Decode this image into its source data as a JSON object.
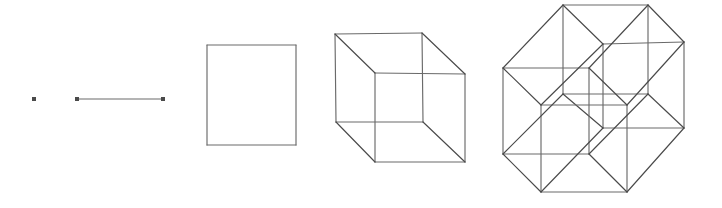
{
  "figure": {
    "background_color": "#ffffff",
    "stroke_color": "#6a6a6a",
    "stroke_color_dark": "#4a4a4a",
    "vertex_color": "#4a4a4a",
    "stroke_width": 1.15,
    "canvas": {
      "width": 722,
      "height": 208
    }
  },
  "objects": [
    {
      "name": "point",
      "label": "0-dimensional point",
      "dimension": 0,
      "vertex_count": 1,
      "edge_count": 0,
      "points": [
        [
          34,
          99
        ]
      ],
      "dot_radius": 2.0
    },
    {
      "name": "line-segment",
      "label": "1-dimensional line segment",
      "dimension": 1,
      "vertex_count": 2,
      "edge_count": 1,
      "points": [
        [
          77,
          99
        ],
        [
          163,
          99
        ]
      ],
      "edges": [
        [
          0,
          1
        ]
      ],
      "dot_radius": 2.0
    },
    {
      "name": "square",
      "label": "2-dimensional square",
      "dimension": 2,
      "vertex_count": 4,
      "edge_count": 4,
      "points": [
        [
          207,
          45
        ],
        [
          296,
          45
        ],
        [
          296,
          145
        ],
        [
          207,
          145
        ]
      ],
      "edges": [
        [
          0,
          1
        ],
        [
          1,
          2
        ],
        [
          2,
          3
        ],
        [
          3,
          0
        ]
      ]
    },
    {
      "name": "cube",
      "label": "3-dimensional cube",
      "dimension": 3,
      "vertex_count": 8,
      "edge_count": 12,
      "points": [
        [
          335,
          34
        ],
        [
          422,
          33
        ],
        [
          423,
          122
        ],
        [
          336,
          122
        ],
        [
          375,
          73
        ],
        [
          465,
          74
        ],
        [
          465,
          162
        ],
        [
          375,
          162
        ]
      ],
      "edges": [
        [
          0,
          1
        ],
        [
          1,
          2
        ],
        [
          2,
          3
        ],
        [
          3,
          0
        ],
        [
          4,
          5
        ],
        [
          5,
          6
        ],
        [
          6,
          7
        ],
        [
          7,
          4
        ],
        [
          0,
          4
        ],
        [
          1,
          5
        ],
        [
          2,
          6
        ],
        [
          3,
          7
        ]
      ]
    },
    {
      "name": "tesseract",
      "label": "4-dimensional tesseract (hypercube)",
      "dimension": 4,
      "vertex_count": 16,
      "edge_count": 32,
      "points": [
        [
          563,
          5
        ],
        [
          648,
          5
        ],
        [
          648,
          94
        ],
        [
          563,
          94
        ],
        [
          603,
          44
        ],
        [
          684,
          42
        ],
        [
          684,
          128
        ],
        [
          603,
          128
        ],
        [
          503,
          68
        ],
        [
          589,
          68
        ],
        [
          589,
          154
        ],
        [
          503,
          154
        ],
        [
          541,
          105
        ],
        [
          627,
          105
        ],
        [
          627,
          192
        ],
        [
          541,
          192
        ]
      ],
      "edges": [
        [
          0,
          1
        ],
        [
          1,
          2
        ],
        [
          2,
          3
        ],
        [
          3,
          0
        ],
        [
          4,
          5
        ],
        [
          5,
          6
        ],
        [
          6,
          7
        ],
        [
          7,
          4
        ],
        [
          0,
          4
        ],
        [
          1,
          5
        ],
        [
          2,
          6
        ],
        [
          3,
          7
        ],
        [
          8,
          9
        ],
        [
          9,
          10
        ],
        [
          10,
          11
        ],
        [
          11,
          8
        ],
        [
          12,
          13
        ],
        [
          13,
          14
        ],
        [
          14,
          15
        ],
        [
          15,
          12
        ],
        [
          8,
          12
        ],
        [
          9,
          13
        ],
        [
          10,
          14
        ],
        [
          11,
          15
        ],
        [
          0,
          8
        ],
        [
          1,
          9
        ],
        [
          2,
          10
        ],
        [
          3,
          11
        ],
        [
          4,
          12
        ],
        [
          5,
          13
        ],
        [
          6,
          14
        ],
        [
          7,
          15
        ]
      ]
    }
  ]
}
